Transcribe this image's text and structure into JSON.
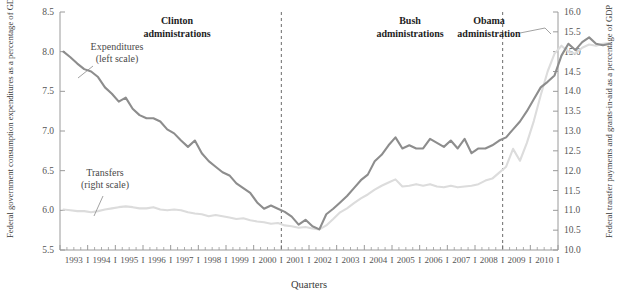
{
  "chart_data": {
    "type": "line",
    "title": "",
    "xlabel": "Quarters",
    "ylabel": "Federal government consumption expenditures as a percentage of GDP",
    "y2label": "Federal transfer payments and grants-in-aid as a percentage of GDP",
    "xlim": [
      1993.0,
      2011.0
    ],
    "ylim": [
      5.5,
      8.5
    ],
    "y2lim": [
      10.0,
      16.0
    ],
    "grid": false,
    "legend_position": "inline-annotation",
    "y_ticks": [
      "5.5",
      "6.0",
      "6.5",
      "7.0",
      "7.5",
      "8.0",
      "8.5"
    ],
    "y2_ticks": [
      "10.0",
      "10.5",
      "11.0",
      "11.5",
      "12.0",
      "12.5",
      "13.0",
      "13.5",
      "14.0",
      "14.5",
      "15.0",
      "15.5",
      "16.0"
    ],
    "x_tick_labels": [
      "1993",
      "1994",
      "1995",
      "1996",
      "1997",
      "1998",
      "1999",
      "2000",
      "2001",
      "2002",
      "2003",
      "2004",
      "2005",
      "2006",
      "2007",
      "2008",
      "2009",
      "2010"
    ],
    "x_tick_separator": "I",
    "colors": {
      "expenditures": "#8d8d8d",
      "transfers": "#dcdcdc",
      "axis": "#9a9a9a",
      "divider": "#6b6b6b",
      "text": "#3a3a3a"
    },
    "series": [
      {
        "name": "Expenditures",
        "scale": "left",
        "label_line1": "Expenditures",
        "label_line2": "(left scale)",
        "color": "#8d8d8d",
        "values": [
          8.0,
          7.93,
          7.85,
          7.78,
          7.75,
          7.68,
          7.55,
          7.47,
          7.37,
          7.42,
          7.28,
          7.2,
          7.16,
          7.16,
          7.12,
          7.02,
          6.97,
          6.88,
          6.8,
          6.88,
          6.72,
          6.62,
          6.55,
          6.48,
          6.44,
          6.34,
          6.28,
          6.22,
          6.1,
          6.02,
          6.06,
          6.02,
          5.98,
          5.92,
          5.82,
          5.88,
          5.8,
          5.76,
          5.95,
          6.02,
          6.1,
          6.18,
          6.28,
          6.38,
          6.45,
          6.62,
          6.7,
          6.82,
          6.92,
          6.78,
          6.82,
          6.78,
          6.78,
          6.9,
          6.85,
          6.8,
          6.88,
          6.78,
          6.9,
          6.72,
          6.78,
          6.78,
          6.82,
          6.88,
          6.92,
          7.02,
          7.12,
          7.25,
          7.4,
          7.55,
          7.62,
          7.7,
          7.95,
          8.1,
          8.02,
          8.12,
          8.18,
          8.1,
          8.08,
          8.1
        ]
      },
      {
        "name": "Transfers",
        "scale": "right",
        "label_line1": "Transfers",
        "label_line2": "(right scale)",
        "color": "#dcdcdc",
        "values": [
          11.02,
          11.0,
          10.98,
          10.98,
          10.95,
          10.98,
          11.02,
          11.05,
          11.08,
          11.1,
          11.08,
          11.05,
          11.05,
          11.08,
          11.02,
          11.0,
          11.02,
          11.0,
          10.95,
          10.92,
          10.9,
          10.85,
          10.88,
          10.85,
          10.82,
          10.78,
          10.8,
          10.75,
          10.72,
          10.7,
          10.66,
          10.68,
          10.62,
          10.6,
          10.56,
          10.58,
          10.54,
          10.52,
          10.62,
          10.78,
          10.95,
          11.05,
          11.18,
          11.3,
          11.4,
          11.52,
          11.62,
          11.7,
          11.78,
          11.6,
          11.62,
          11.66,
          11.62,
          11.66,
          11.6,
          11.58,
          11.62,
          11.58,
          11.6,
          11.62,
          11.66,
          11.75,
          11.8,
          11.95,
          12.1,
          12.55,
          12.25,
          12.7,
          13.25,
          13.9,
          14.5,
          14.95,
          15.15,
          15.0,
          14.95,
          15.1,
          15.18,
          15.15,
          15.2,
          15.22
        ]
      }
    ],
    "annotations": [
      {
        "id": "clinton",
        "line1": "Clinton",
        "line2": "administrations"
      },
      {
        "id": "bush",
        "line1": "Bush",
        "line2": "administrations"
      },
      {
        "id": "obama",
        "line1": "Obama",
        "line2": "administration"
      }
    ],
    "dividers": [
      {
        "id": "divider-2001",
        "at_year": 2001
      },
      {
        "id": "divider-2009",
        "at_year": 2009
      }
    ]
  }
}
